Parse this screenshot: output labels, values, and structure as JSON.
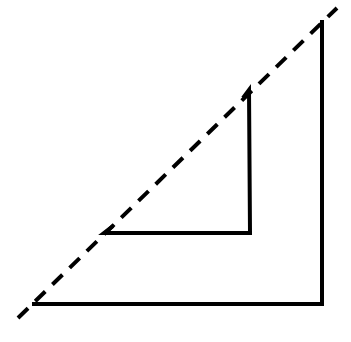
{
  "diagram": {
    "width": 351,
    "height": 342,
    "background": "#ffffff",
    "stroke_color": "#000000",
    "dashed_line": {
      "x1": 18,
      "y1": 318,
      "x2": 337,
      "y2": 8,
      "dash": "14 10",
      "width": 4
    },
    "outer_corner": {
      "points": "32,304 322,304 322,20",
      "width": 4
    },
    "inner_corner": {
      "points": "104,233 113,226 104,233 250,233 249,90 243,98",
      "width": 4
    }
  }
}
